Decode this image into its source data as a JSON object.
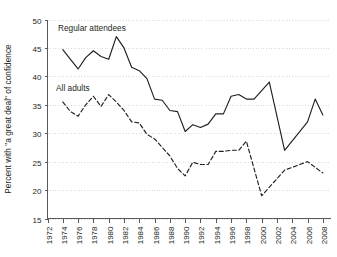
{
  "chart_data": {
    "type": "line",
    "title": "",
    "xlabel": "",
    "ylabel": "Percent with \"a great deal\" of confidence",
    "ylim": [
      15,
      50
    ],
    "ytick_step": 5,
    "yticks": [
      15,
      20,
      25,
      30,
      35,
      40,
      45,
      50
    ],
    "xlim": [
      1972,
      2009
    ],
    "xticks": [
      1972,
      1974,
      1976,
      1978,
      1980,
      1982,
      1984,
      1986,
      1988,
      1990,
      1992,
      1994,
      1996,
      1998,
      2000,
      2002,
      2004,
      2006,
      2008
    ],
    "grid": "horizontal-dotted",
    "legend_position": "inline-annotations",
    "line_color": "#231f20",
    "grid_color": "#d9d3cf",
    "axis_color": "#58595b",
    "series": [
      {
        "name": "Regular attendees",
        "style": "solid",
        "label_x": 1975,
        "label_y": 48.6,
        "x": [
          1974,
          1975,
          1976,
          1977,
          1978,
          1980,
          1982,
          1983,
          1984,
          1985,
          1986,
          1987,
          1988,
          1989,
          1990,
          1991,
          1993,
          1994,
          1996,
          1998,
          2000,
          2002,
          2004,
          2006,
          2008
        ],
        "values": [
          44.7,
          43.0,
          41.3,
          43.3,
          44.5,
          43.0,
          47.0,
          45.0,
          41.6,
          41.0,
          39.6,
          36.0,
          35.8,
          34.0,
          33.8,
          30.3,
          31.5,
          31.0,
          31.6,
          33.4,
          33.4,
          36.5,
          36.8,
          36.0,
          33.3
        ]
      },
      {
        "name": "All adults",
        "style": "dashed",
        "label_x": 1975,
        "label_y": 38.0,
        "x": [
          1974,
          1975,
          1976,
          1977,
          1978,
          1980,
          1982,
          1983,
          1984,
          1985,
          1986,
          1987,
          1988,
          1989,
          1990,
          1991,
          1993,
          1994,
          1996,
          1998,
          2000,
          2002,
          2004,
          2006,
          2008
        ],
        "values": [
          35.5,
          34.0,
          33.0,
          35.0,
          36.5,
          34.7,
          36.8,
          35.5,
          33.5,
          32.0,
          31.8,
          29.8,
          29.0,
          27.5,
          26.0,
          23.8,
          22.5,
          24.0,
          24.9,
          24.5,
          24.6,
          24.5,
          26.5,
          27.0,
          27.0
        ]
      }
    ],
    "series_points": {
      "Regular attendees": [
        [
          1974,
          44.7
        ],
        [
          1975,
          43.0
        ],
        [
          1976,
          41.3
        ],
        [
          1977,
          43.3
        ],
        [
          1978,
          44.5
        ],
        [
          1979,
          43.5
        ],
        [
          1980,
          43.0
        ],
        [
          1981,
          47.0
        ],
        [
          1982,
          45.0
        ],
        [
          1983,
          41.6
        ],
        [
          1984,
          41.0
        ],
        [
          1985,
          39.6
        ],
        [
          1986,
          36.0
        ],
        [
          1987,
          35.8
        ],
        [
          1988,
          34.0
        ],
        [
          1989,
          33.8
        ],
        [
          1990,
          30.3
        ],
        [
          1991,
          31.5
        ],
        [
          1992,
          31.0
        ],
        [
          1993,
          31.6
        ],
        [
          1994,
          33.4
        ],
        [
          1995,
          33.4
        ],
        [
          1996,
          36.5
        ],
        [
          1997,
          36.8
        ],
        [
          1998,
          36.0
        ],
        [
          1999,
          36.0
        ],
        [
          2000,
          37.5
        ],
        [
          2001,
          39.0
        ],
        [
          2003,
          27.0
        ],
        [
          2006,
          32.0
        ],
        [
          2007,
          36.0
        ],
        [
          2008,
          33.2
        ]
      ],
      "All adults": [
        [
          1974,
          35.5
        ],
        [
          1975,
          33.8
        ],
        [
          1976,
          33.0
        ],
        [
          1977,
          35.0
        ],
        [
          1978,
          36.5
        ],
        [
          1979,
          34.7
        ],
        [
          1980,
          36.8
        ],
        [
          1981,
          35.5
        ],
        [
          1982,
          34.0
        ],
        [
          1983,
          32.0
        ],
        [
          1984,
          31.8
        ],
        [
          1985,
          29.8
        ],
        [
          1986,
          29.0
        ],
        [
          1987,
          27.5
        ],
        [
          1988,
          26.0
        ],
        [
          1989,
          23.8
        ],
        [
          1990,
          22.5
        ],
        [
          1991,
          24.9
        ],
        [
          1992,
          24.5
        ],
        [
          1993,
          24.5
        ],
        [
          1994,
          26.8
        ],
        [
          1995,
          26.8
        ],
        [
          1996,
          27.0
        ],
        [
          1997,
          27.0
        ],
        [
          1998,
          28.6
        ],
        [
          2000,
          19.0
        ],
        [
          2003,
          23.5
        ],
        [
          2006,
          25.0
        ],
        [
          2008,
          23.0
        ]
      ]
    }
  },
  "axes": {
    "y_axis_title": "Percent with \"a great deal\" of confidence",
    "y_tick_labels": [
      "50",
      "45",
      "40",
      "35",
      "30",
      "25",
      "20",
      "15"
    ],
    "x_tick_labels": [
      "1972",
      "1974",
      "1976",
      "1978",
      "1980",
      "1982",
      "1984",
      "1986",
      "1988",
      "1990",
      "1992",
      "1994",
      "1996",
      "1998",
      "2000",
      "2002",
      "2004",
      "2006",
      "2008"
    ]
  },
  "annotations": {
    "regular_attendees": "Regular attendees",
    "all_adults": "All adults"
  }
}
